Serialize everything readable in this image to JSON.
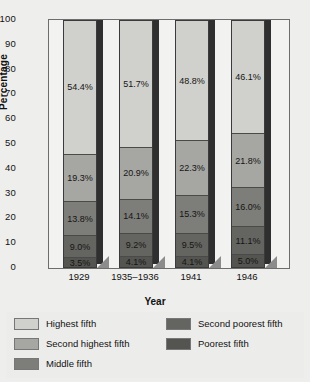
{
  "chart_data": {
    "type": "bar",
    "variant": "stacked-100-percent",
    "title": "",
    "xlabel": "Year",
    "ylabel": "Percentage",
    "ylim": [
      0,
      100
    ],
    "ytick_step": 10,
    "yticks": [
      "100",
      "90",
      "80",
      "70",
      "60",
      "50",
      "40",
      "30",
      "20",
      "10",
      "0"
    ],
    "grid": false,
    "legend_position": "bottom",
    "categories": [
      "1929",
      "1935–1936",
      "1941",
      "1946"
    ],
    "series": [
      {
        "name": "Highest fifth",
        "color": "#d0d0cc",
        "values": [
          54.4,
          51.7,
          48.8,
          46.1
        ],
        "labels": [
          "54.4%",
          "51.7%",
          "48.8%",
          "46.1%"
        ]
      },
      {
        "name": "Second highest fifth",
        "color": "#a6a6a2",
        "values": [
          19.3,
          20.9,
          22.3,
          21.8
        ],
        "labels": [
          "19.3%",
          "20.9%",
          "22.3%",
          "21.8%"
        ]
      },
      {
        "name": "Middle fifth",
        "color": "#7d7d79",
        "values": [
          13.8,
          14.1,
          15.3,
          16.0
        ],
        "labels": [
          "13.8%",
          "14.1%",
          "15.3%",
          "16.0%"
        ]
      },
      {
        "name": "Second poorest fifth",
        "color": "#646460",
        "values": [
          9.0,
          9.2,
          9.5,
          11.1
        ],
        "labels": [
          "9.0%",
          "9.2%",
          "9.5%",
          "11.1%"
        ]
      },
      {
        "name": "Poorest fifth",
        "color": "#545450",
        "values": [
          3.5,
          4.1,
          4.1,
          5.0
        ],
        "labels": [
          "3.5%",
          "4.1%",
          "4.1%",
          "5.0%"
        ]
      }
    ]
  },
  "axis": {
    "y_title": "Percentage",
    "x_title": "Year"
  },
  "legend": {
    "column_left": [
      {
        "label": "Highest fifth",
        "color": "#d0d0cc"
      },
      {
        "label": "Second highest fifth",
        "color": "#a6a6a2"
      },
      {
        "label": "Middle fifth",
        "color": "#7d7d79"
      }
    ],
    "column_right": [
      {
        "label": "Second poorest fifth",
        "color": "#646460"
      },
      {
        "label": "Poorest fifth",
        "color": "#545450"
      }
    ]
  }
}
